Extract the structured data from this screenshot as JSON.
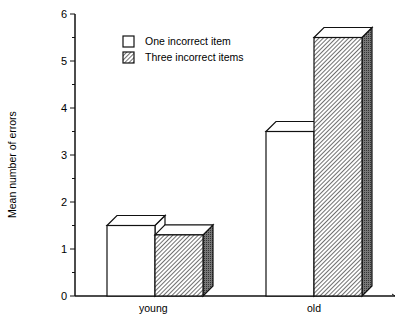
{
  "chart_data": {
    "type": "bar",
    "style": "3d-bar",
    "title": "",
    "xlabel": "",
    "ylabel": "Mean number of errors",
    "ylim": [
      0,
      6
    ],
    "yticks": [
      "0",
      "1",
      "2",
      "3",
      "4",
      "5",
      "6"
    ],
    "categories": [
      "young",
      "old"
    ],
    "series": [
      {
        "name": "One incorrect item",
        "fill": "white",
        "values": [
          1.5,
          3.5
        ]
      },
      {
        "name": "Three incorrect items",
        "fill": "hatched",
        "values": [
          1.3,
          5.5
        ]
      }
    ],
    "grid": false,
    "legend_position": "upper-center"
  },
  "labels": {
    "ylabel": "Mean number of errors",
    "yticks": [
      "0",
      "1",
      "2",
      "3",
      "4",
      "5",
      "6"
    ],
    "categories": [
      "young",
      "old"
    ],
    "legend": [
      "One incorrect item",
      "Three incorrect items"
    ]
  }
}
